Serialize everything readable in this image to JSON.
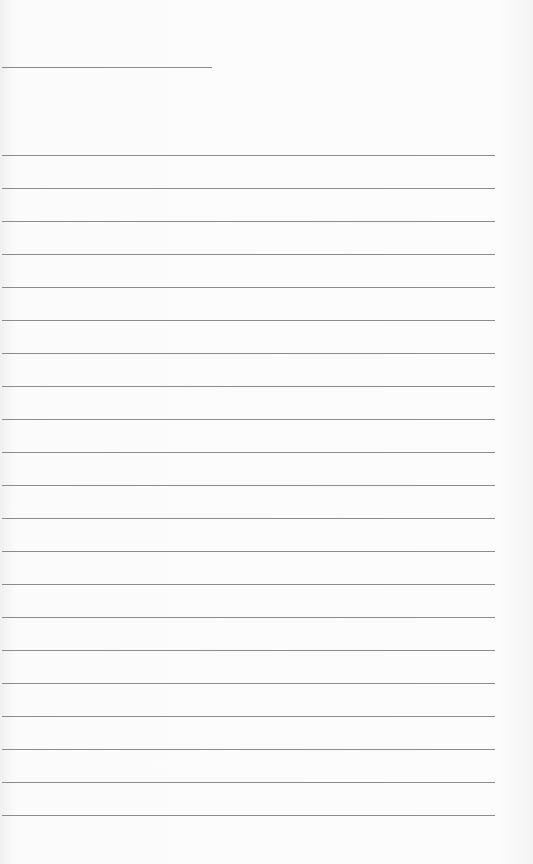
{
  "page": {
    "type": "lined-paper",
    "background_color": "#fafafa",
    "line_color": "#8c8c8c",
    "header_line": {
      "top": 67,
      "left": 2,
      "width": 210
    },
    "rules": {
      "count": 21,
      "first_top": 155,
      "spacing": 33,
      "left": 2,
      "width": 493
    }
  }
}
